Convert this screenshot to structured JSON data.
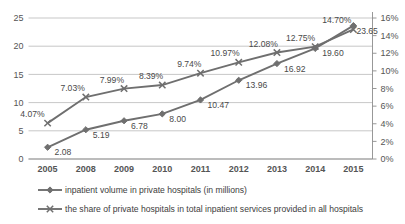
{
  "chart_data": {
    "type": "line",
    "title": "",
    "subtitle": "",
    "xlabel": "",
    "ylabel": "",
    "grid": true,
    "legend_position": "bottom",
    "categories": [
      "2005",
      "2008",
      "2009",
      "2010",
      "2011",
      "2012",
      "2013",
      "2014",
      "2015"
    ],
    "axes": {
      "left": {
        "ticks": [
          "25",
          "20",
          "15",
          "10",
          "5",
          "0"
        ],
        "tick_values": [
          25,
          20,
          15,
          10,
          5,
          0
        ],
        "ylim": [
          0,
          25
        ],
        "label": ""
      },
      "right": {
        "ticks": [
          "16%",
          "14%",
          "12%",
          "10%",
          "8%",
          "6%",
          "4%",
          "2%",
          "0%"
        ],
        "tick_values": [
          16,
          14,
          12,
          10,
          8,
          6,
          4,
          2,
          0
        ],
        "ylim": [
          0,
          16
        ],
        "label": ""
      }
    },
    "series": [
      {
        "name": "inpatient volume in private hospitals (in millions)",
        "axis": "left",
        "marker": "diamond",
        "color": "#6f6f6f",
        "values": [
          2.08,
          5.19,
          6.78,
          8.0,
          10.47,
          13.96,
          16.92,
          19.6,
          23.65
        ],
        "labels": [
          "2.08",
          "5.19",
          "6.78",
          "8.00",
          "10.47",
          "13.96",
          "16.92",
          "19.60",
          "23.65"
        ]
      },
      {
        "name": "the share of private hospitals in total inpatient services provided in all hospitals",
        "axis": "right",
        "marker": "x",
        "color": "#6f6f6f",
        "values": [
          4.07,
          7.03,
          7.99,
          8.39,
          9.74,
          10.97,
          12.08,
          12.75,
          14.7
        ],
        "labels": [
          "4.07%",
          "7.03%",
          "7.99%",
          "8.39%",
          "9.74%",
          "10.97%",
          "12.08%",
          "12.75%",
          "14.70%"
        ]
      }
    ],
    "colors": {
      "series": "#6f6f6f",
      "grid": "#b9b9b9",
      "axis": "#8c8c8c",
      "text": "#4a4a4a",
      "background": "#ffffff"
    }
  },
  "legend": {
    "items": [
      {
        "label": "inpatient volume in private hospitals (in millions)",
        "marker": "diamond"
      },
      {
        "label": "the share of private hospitals in total inpatient services provided in all hospitals",
        "marker": "x"
      }
    ]
  }
}
